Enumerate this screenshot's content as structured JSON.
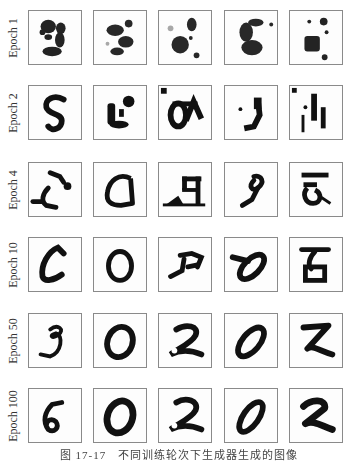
{
  "figure": {
    "rows": [
      {
        "label": "Epoch 1",
        "samples": [
          "noisy-3",
          "noisy-5",
          "noisy-blob",
          "noisy-6",
          "noisy-blob"
        ]
      },
      {
        "label": "Epoch 2",
        "samples": [
          "5",
          "noisy-0",
          "noisy-8",
          "noisy-9",
          "noisy-fragments"
        ]
      },
      {
        "label": "Epoch 4",
        "samples": [
          "noisy-2",
          "0",
          "noisy-7",
          "noisy-8",
          "noisy-5"
        ]
      },
      {
        "label": "Epoch 10",
        "samples": [
          "0",
          "0",
          "noisy-7",
          "0",
          "8"
        ]
      },
      {
        "label": "Epoch 50",
        "samples": [
          "3",
          "0",
          "2",
          "0",
          "2"
        ]
      },
      {
        "label": "Epoch 100",
        "samples": [
          "6",
          "0",
          "2",
          "0",
          "2"
        ]
      }
    ],
    "caption": "图 17-17　不同训练轮次下生成器生成的图像"
  }
}
